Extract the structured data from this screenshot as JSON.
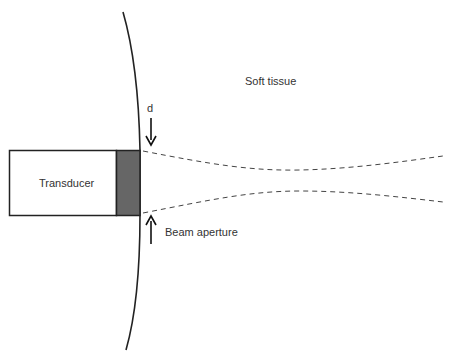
{
  "diagram": {
    "labels": {
      "soft_tissue": "Soft tissue",
      "transducer": "Transducer",
      "d": "d",
      "beam_aperture": "Beam aperture"
    },
    "colors": {
      "stroke": "#222222",
      "element_fill": "#666666",
      "dashed": "#444444",
      "text": "#333333",
      "background": "#ffffff"
    },
    "shapes": {
      "skin_surface": "curved tissue boundary",
      "transducer_body": "rectangle",
      "piezo_element": "shaded rectangle",
      "beam_edges": "dashed converging-diverging lines",
      "arrow_d": "downward arrow",
      "arrow_aperture": "upward arrow"
    }
  }
}
